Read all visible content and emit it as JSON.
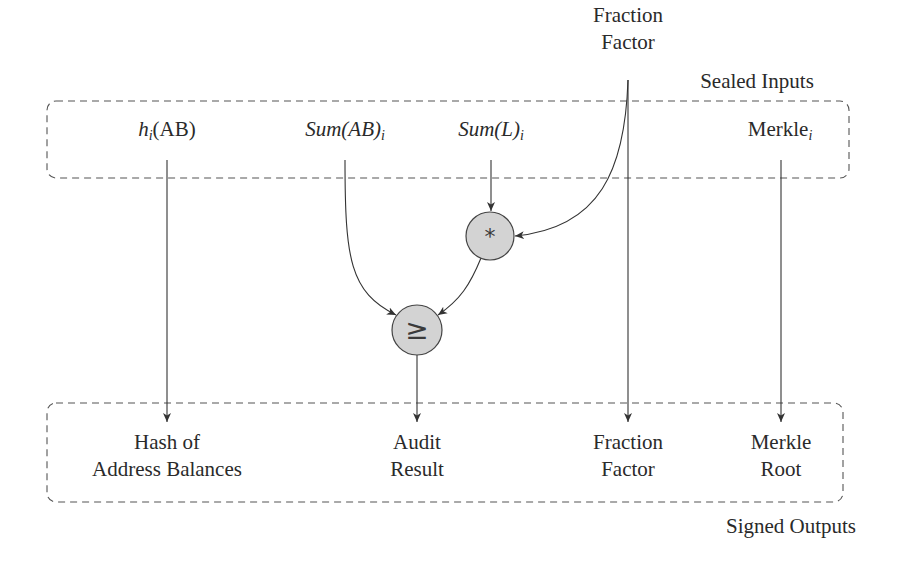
{
  "diagram": {
    "groups": {
      "sealed_inputs": {
        "label": "Sealed Inputs"
      },
      "signed_outputs": {
        "label": "Signed Outputs"
      }
    },
    "external_input": {
      "line1": "Fraction",
      "line2": "Factor"
    },
    "inputs": {
      "hash": {
        "base": "h",
        "sub": "i",
        "rest": "(AB)"
      },
      "sum_ab": {
        "base": "Sum(AB)",
        "sub": "i"
      },
      "sum_l": {
        "base": "Sum(L)",
        "sub": "i"
      },
      "merkle": {
        "base": "Merkle",
        "sub": "i"
      }
    },
    "operators": {
      "multiply": {
        "symbol": "*"
      },
      "compare": {
        "symbol": "≥"
      }
    },
    "outputs": {
      "hash": {
        "line1": "Hash of",
        "line2": "Address Balances"
      },
      "audit": {
        "line1": "Audit",
        "line2": "Result"
      },
      "fraction": {
        "line1": "Fraction",
        "line2": "Factor"
      },
      "merkle": {
        "line1": "Merkle",
        "line2": "Root"
      }
    },
    "colors": {
      "operator_fill": "#d3d3d3",
      "stroke": "#333333"
    }
  }
}
